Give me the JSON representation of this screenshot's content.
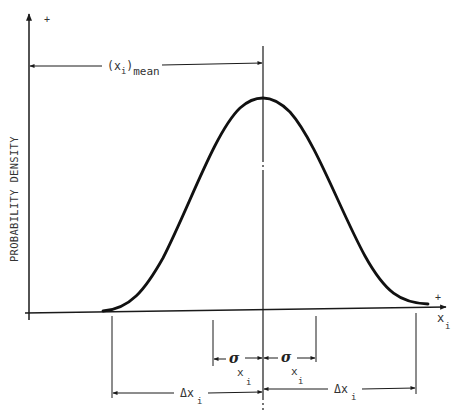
{
  "diagram": {
    "type": "normal-distribution-annotation",
    "y_axis": {
      "label": "PROBABILITY DENSITY",
      "positive_marker": "+"
    },
    "x_axis": {
      "label_main": "x",
      "label_sub": "i",
      "positive_marker": "+"
    },
    "mean_dimension": {
      "paren_open": "(",
      "var": "x",
      "var_sub": "i",
      "paren_close": ")",
      "subscript": "mean"
    },
    "sigma_left": {
      "symbol": "σ",
      "sub": "x",
      "sub2": "i"
    },
    "sigma_right": {
      "symbol": "σ",
      "sub": "x",
      "sub2": "i"
    },
    "delta_left": {
      "symbol": "Δx",
      "sub": "i"
    },
    "delta_right": {
      "symbol": "Δx",
      "sub": "i"
    },
    "colors": {
      "ink": "#1a1a1a",
      "background": "#ffffff"
    }
  }
}
